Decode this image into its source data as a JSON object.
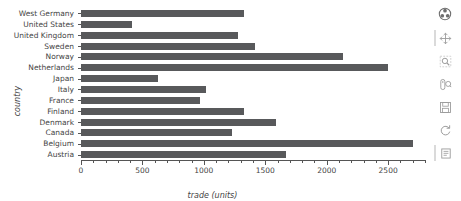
{
  "chart_data": {
    "type": "bar",
    "orientation": "horizontal",
    "title": "",
    "xlabel": "trade (units)",
    "ylabel": "country",
    "xlim": [
      0,
      2800
    ],
    "ylim": null,
    "grid": false,
    "legend": null,
    "bar_color": "#58595b",
    "background": "#ffffff",
    "xticks": [
      0,
      500,
      1000,
      1500,
      2000,
      2500
    ],
    "xtick_labels": [
      "0",
      "500",
      "1000",
      "1500",
      "2000",
      "2500"
    ],
    "minor_tick_step": 100,
    "categories": [
      "West Germany",
      "United States",
      "United Kingdom",
      "Sweden",
      "Norway",
      "Netherlands",
      "Japan",
      "Italy",
      "France",
      "Finland",
      "Denmark",
      "Canada",
      "Belgium",
      "Austria"
    ],
    "values": [
      1330,
      415,
      1275,
      1420,
      2130,
      2500,
      625,
      1020,
      970,
      1330,
      1590,
      1230,
      2700,
      1670
    ]
  },
  "toolbar": {
    "tools": [
      {
        "name": "bokeh-logo-icon",
        "label": "Bokeh"
      },
      {
        "name": "pan-tool-icon",
        "label": "Pan"
      },
      {
        "name": "box-zoom-tool-icon",
        "label": "Box Zoom"
      },
      {
        "name": "wheel-zoom-tool-icon",
        "label": "Wheel Zoom"
      },
      {
        "name": "save-tool-icon",
        "label": "Save"
      },
      {
        "name": "reset-tool-icon",
        "label": "Reset"
      },
      {
        "name": "help-tool-icon",
        "label": "Help"
      }
    ]
  }
}
